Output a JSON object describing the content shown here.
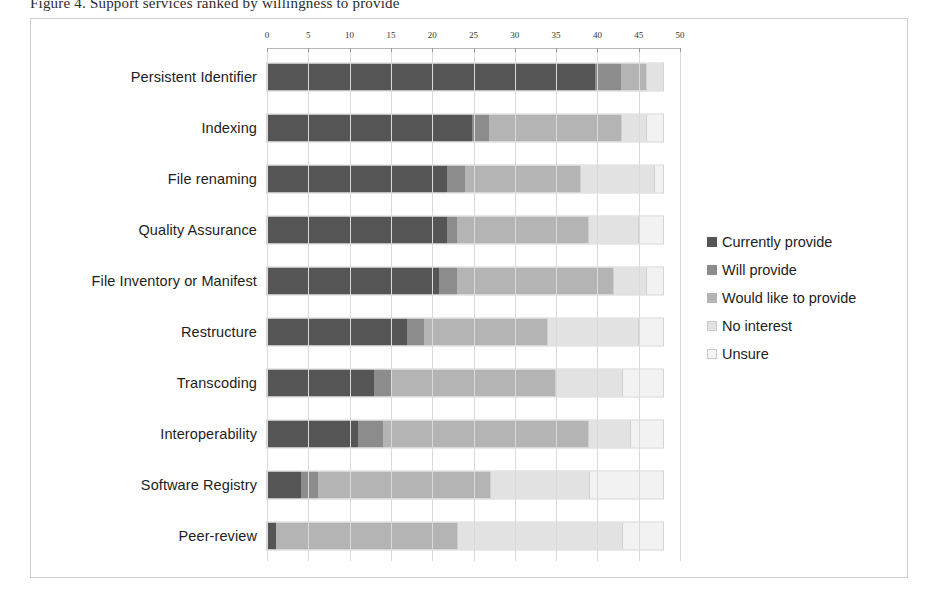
{
  "caption_remnant": "Figure 4. Support services ranked by willingness to provide",
  "chart_data": {
    "type": "bar",
    "orientation": "horizontal",
    "stacked": true,
    "title": "",
    "xlabel": "",
    "ylabel": "",
    "xlim": [
      0,
      50
    ],
    "xticks": [
      0,
      5,
      10,
      15,
      20,
      25,
      30,
      35,
      40,
      45,
      50
    ],
    "xtick_labels": [
      "0",
      "5",
      "10",
      "15",
      "20",
      "25",
      "30",
      "35",
      "40",
      "45",
      "50"
    ],
    "grid": true,
    "legend_position": "right",
    "categories": [
      "Persistent Identifier",
      "Indexing",
      "File renaming",
      "Quality Assurance",
      "File Inventory or Manifest",
      "Restructure",
      "Transcoding",
      "Interoperability",
      "Software Registry",
      "Peer-review"
    ],
    "series": [
      {
        "name": "Currently provide",
        "color": "#555555",
        "values": [
          40,
          25,
          22,
          22,
          21,
          17,
          13,
          11,
          4,
          1
        ]
      },
      {
        "name": "Will provide",
        "color": "#8c8c8c",
        "values": [
          3,
          2,
          2,
          1,
          2,
          2,
          2,
          3,
          2,
          0
        ]
      },
      {
        "name": "Would like to provide",
        "color": "#b4b4b4",
        "values": [
          3,
          16,
          14,
          16,
          19,
          15,
          20,
          25,
          21,
          22
        ]
      },
      {
        "name": "No interest",
        "color": "#e2e2e2",
        "values": [
          2,
          3,
          9,
          6,
          4,
          11,
          8,
          5,
          12,
          20
        ]
      },
      {
        "name": "Unsure",
        "color": "#f2f2f2",
        "values": [
          0,
          2,
          1,
          3,
          2,
          3,
          5,
          4,
          9,
          5
        ]
      }
    ],
    "row_totals": [
      48,
      48,
      48,
      48,
      48,
      48,
      48,
      48,
      48,
      48
    ]
  }
}
